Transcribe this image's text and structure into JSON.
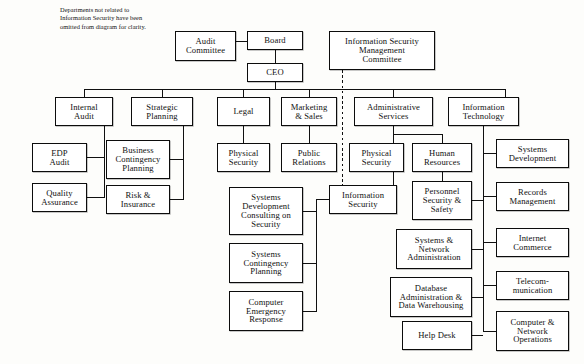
{
  "diagram": {
    "note": "Departments not related to\nInformation Security have been\nomitted from diagram for clarity.",
    "line_color": "#101010",
    "box_fill": "#ffffff"
  },
  "nodes": [
    {
      "id": "audit-committee",
      "label": "Audit\nCommittee",
      "x": 175,
      "y": 31,
      "w": 61,
      "h": 30
    },
    {
      "id": "board",
      "label": "Board",
      "x": 247,
      "y": 31,
      "w": 56,
      "h": 19
    },
    {
      "id": "ceo",
      "label": "CEO",
      "x": 247,
      "y": 63,
      "w": 56,
      "h": 19
    },
    {
      "id": "ismc",
      "label": "Information Security\nManagement\nCommittee",
      "x": 329,
      "y": 31,
      "w": 106,
      "h": 39
    },
    {
      "id": "internal-audit",
      "label": "Internal\nAudit",
      "x": 55,
      "y": 97,
      "w": 58,
      "h": 29
    },
    {
      "id": "strategic-planning",
      "label": "Strategic\nPlanning",
      "x": 131,
      "y": 97,
      "w": 62,
      "h": 29
    },
    {
      "id": "legal",
      "label": "Legal",
      "x": 217,
      "y": 97,
      "w": 53,
      "h": 29
    },
    {
      "id": "marketing-sales",
      "label": "Marketing\n& Sales",
      "x": 281,
      "y": 97,
      "w": 56,
      "h": 29
    },
    {
      "id": "admin-services",
      "label": "Administrative\nServices",
      "x": 354,
      "y": 97,
      "w": 79,
      "h": 29
    },
    {
      "id": "information-tech",
      "label": "Information\nTechnology",
      "x": 448,
      "y": 97,
      "w": 71,
      "h": 29
    },
    {
      "id": "edp-audit",
      "label": "EDP\nAudit",
      "x": 32,
      "y": 143,
      "w": 55,
      "h": 29
    },
    {
      "id": "quality-assurance",
      "label": "Quality\nAssurance",
      "x": 32,
      "y": 183,
      "w": 55,
      "h": 29
    },
    {
      "id": "business-contingency",
      "label": "Business\nContingency\nPlanning",
      "x": 106,
      "y": 140,
      "w": 64,
      "h": 39
    },
    {
      "id": "risk-insurance",
      "label": "Risk &\nInsurance",
      "x": 106,
      "y": 185,
      "w": 64,
      "h": 29
    },
    {
      "id": "physical-security-legal",
      "label": "Physical\nSecurity",
      "x": 217,
      "y": 143,
      "w": 53,
      "h": 29
    },
    {
      "id": "public-relations",
      "label": "Public\nRelations",
      "x": 281,
      "y": 143,
      "w": 56,
      "h": 29
    },
    {
      "id": "sys-dev-consulting",
      "label": "Systems\nDevelopment\nConsulting on\nSecurity",
      "x": 229,
      "y": 187,
      "w": 74,
      "h": 48
    },
    {
      "id": "sys-contingency",
      "label": "Systems\nContingency\nPlanning",
      "x": 229,
      "y": 243,
      "w": 74,
      "h": 40
    },
    {
      "id": "computer-emergency",
      "label": "Computer\nEmergency\nResponse",
      "x": 229,
      "y": 291,
      "w": 74,
      "h": 40
    },
    {
      "id": "physical-security-admin",
      "label": "Physical\nSecurity",
      "x": 349,
      "y": 143,
      "w": 55,
      "h": 29
    },
    {
      "id": "information-security",
      "label": "Information\nSecurity",
      "x": 329,
      "y": 185,
      "w": 68,
      "h": 29
    },
    {
      "id": "human-resources",
      "label": "Human\nResources",
      "x": 412,
      "y": 143,
      "w": 60,
      "h": 29
    },
    {
      "id": "personnel-security",
      "label": "Personnel\nSecurity &\nSafety",
      "x": 412,
      "y": 181,
      "w": 60,
      "h": 39
    },
    {
      "id": "systems-network",
      "label": "Systems &\nNetwork\nAdministration",
      "x": 396,
      "y": 229,
      "w": 76,
      "h": 40
    },
    {
      "id": "database-admin",
      "label": "Database\nAdministration &\nData Warehousing",
      "x": 390,
      "y": 277,
      "w": 82,
      "h": 40
    },
    {
      "id": "help-desk",
      "label": "Help Desk",
      "x": 402,
      "y": 321,
      "w": 70,
      "h": 29
    },
    {
      "id": "systems-development",
      "label": "Systems\nDevelopment",
      "x": 496,
      "y": 139,
      "w": 73,
      "h": 29
    },
    {
      "id": "records-management",
      "label": "Records\nManagement",
      "x": 496,
      "y": 182,
      "w": 73,
      "h": 29
    },
    {
      "id": "internet-commerce",
      "label": "Internet\nCommerce",
      "x": 496,
      "y": 228,
      "w": 73,
      "h": 29
    },
    {
      "id": "telecommunication",
      "label": "Telecom-\nmunication",
      "x": 496,
      "y": 271,
      "w": 73,
      "h": 29
    },
    {
      "id": "computer-network-ops",
      "label": "Computer &\nNetwork\nOperations",
      "x": 496,
      "y": 311,
      "w": 73,
      "h": 40
    }
  ],
  "connections": [
    {
      "from": "audit-committee",
      "to": "board",
      "style": "solid"
    },
    {
      "from": "board",
      "to": "ceo",
      "style": "solid"
    },
    {
      "from": "ceo",
      "to": "internal-audit",
      "style": "solid"
    },
    {
      "from": "ceo",
      "to": "strategic-planning",
      "style": "solid"
    },
    {
      "from": "ceo",
      "to": "legal",
      "style": "solid"
    },
    {
      "from": "ceo",
      "to": "marketing-sales",
      "style": "solid"
    },
    {
      "from": "ceo",
      "to": "admin-services",
      "style": "solid"
    },
    {
      "from": "ceo",
      "to": "information-tech",
      "style": "solid"
    },
    {
      "from": "ismc",
      "to": "information-security",
      "style": "dashed"
    },
    {
      "from": "internal-audit",
      "to": "edp-audit",
      "style": "solid"
    },
    {
      "from": "internal-audit",
      "to": "quality-assurance",
      "style": "solid"
    },
    {
      "from": "strategic-planning",
      "to": "business-contingency",
      "style": "solid"
    },
    {
      "from": "strategic-planning",
      "to": "risk-insurance",
      "style": "solid"
    },
    {
      "from": "legal",
      "to": "physical-security-legal",
      "style": "solid"
    },
    {
      "from": "marketing-sales",
      "to": "public-relations",
      "style": "solid"
    },
    {
      "from": "information-security",
      "to": "sys-dev-consulting",
      "style": "solid"
    },
    {
      "from": "information-security",
      "to": "sys-contingency",
      "style": "solid"
    },
    {
      "from": "information-security",
      "to": "computer-emergency",
      "style": "solid"
    },
    {
      "from": "admin-services",
      "to": "physical-security-admin",
      "style": "solid"
    },
    {
      "from": "admin-services",
      "to": "human-resources",
      "style": "solid"
    },
    {
      "from": "admin-services",
      "to": "information-security",
      "style": "solid"
    },
    {
      "from": "human-resources",
      "to": "personnel-security",
      "style": "solid"
    },
    {
      "from": "information-tech",
      "to": "systems-development",
      "style": "solid"
    },
    {
      "from": "information-tech",
      "to": "records-management",
      "style": "solid"
    },
    {
      "from": "information-tech",
      "to": "internet-commerce",
      "style": "solid"
    },
    {
      "from": "information-tech",
      "to": "telecommunication",
      "style": "solid"
    },
    {
      "from": "information-tech",
      "to": "computer-network-ops",
      "style": "solid"
    },
    {
      "from": "systems-network",
      "to": "internet-commerce",
      "style": "solid"
    },
    {
      "from": "database-admin",
      "to": "telecommunication",
      "style": "solid"
    },
    {
      "from": "help-desk",
      "to": "computer-network-ops",
      "style": "solid"
    }
  ]
}
